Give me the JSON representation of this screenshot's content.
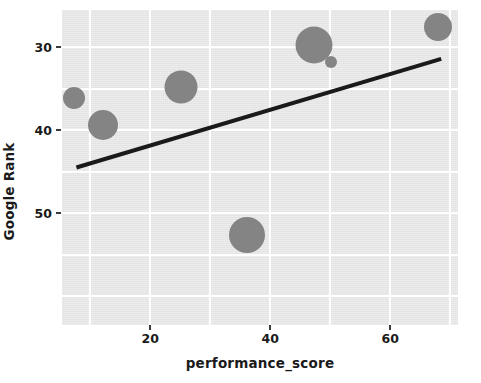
{
  "chart_data": {
    "type": "scatter",
    "title": "",
    "xlabel": "performance_score",
    "ylabel": "Google Rank",
    "xlim": [
      5.3,
      71.3
    ],
    "ylim": [
      63.5,
      25.5
    ],
    "y_inverted": true,
    "grid": true,
    "legend": null,
    "xticks": [
      20,
      40,
      60
    ],
    "xtick_labels": [
      "20",
      "40",
      "60"
    ],
    "yticks": [
      30,
      40,
      50
    ],
    "ytick_labels": [
      "30",
      "40",
      "50"
    ],
    "marker_color": "#848484",
    "trendline_color": "#1a1a1a",
    "background_color": "#e9e9e9",
    "grid_color": "#ffffff",
    "points": [
      {
        "x": 7.3,
        "y": 36.1,
        "size": 11.0
      },
      {
        "x": 12.2,
        "y": 39.4,
        "size": 15.0
      },
      {
        "x": 25.2,
        "y": 34.8,
        "size": 16.5
      },
      {
        "x": 36.2,
        "y": 52.6,
        "size": 18.0
      },
      {
        "x": 47.3,
        "y": 29.7,
        "size": 18.5
      },
      {
        "x": 50.2,
        "y": 31.8,
        "size": 6.0
      },
      {
        "x": 68.0,
        "y": 27.6,
        "size": 14.0
      }
    ],
    "trendline": {
      "x0": 7.7,
      "y0": 44.5,
      "x1": 68.5,
      "y1": 31.4,
      "width": 4
    }
  }
}
